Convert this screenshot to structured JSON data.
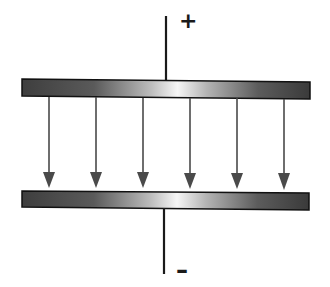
{
  "diagram": {
    "labels": {
      "positive_terminal": "+",
      "negative_terminal": "–"
    },
    "colors": {
      "plate_dark": "#3a3a3a",
      "plate_highlight": "#f4f4f4",
      "plate_border": "#111111",
      "wire": "#1a1a1a",
      "arrow": "#4a4a4a"
    },
    "field_arrows": {
      "count": 6,
      "direction": "down",
      "x_positions": [
        49,
        96,
        143,
        190,
        237,
        284
      ]
    },
    "top_plate": {
      "charge": "positive"
    },
    "bottom_plate": {
      "charge": "negative"
    }
  }
}
